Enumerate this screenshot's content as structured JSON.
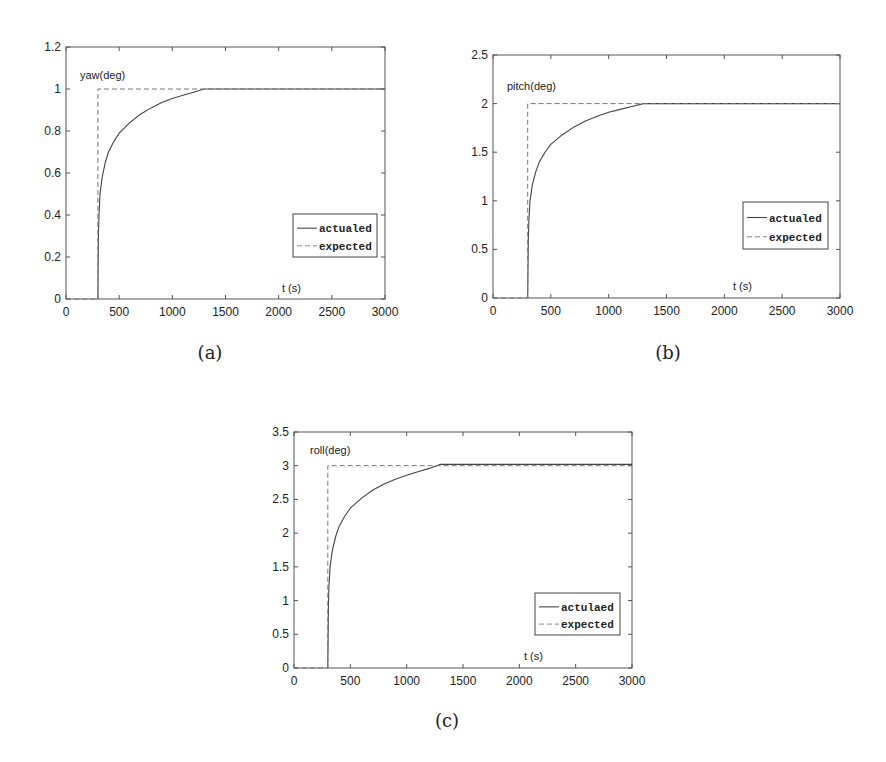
{
  "figure": {
    "captions": [
      "(a)",
      "(b)",
      "(c)"
    ]
  },
  "chart_data": [
    {
      "type": "line",
      "title": "",
      "panel": "(a)",
      "annotation_ylabel": "yaw(deg)",
      "annotation_xlabel": "t (s)",
      "xlabel": "t (s)",
      "ylabel": "yaw(deg)",
      "xlim": [
        0,
        3000
      ],
      "ylim": [
        0,
        1.2
      ],
      "xticks": [
        0,
        500,
        1000,
        1500,
        2000,
        2500,
        3000
      ],
      "yticks": [
        0,
        0.2,
        0.4,
        0.6,
        0.8,
        1,
        1.2
      ],
      "ytick_labels": [
        "0",
        "0.2",
        "0.4",
        "0.6",
        "0.8",
        "1",
        "1.2"
      ],
      "grid": false,
      "legend_position": "lower right",
      "legend": [
        "actualed",
        "expected"
      ],
      "series": [
        {
          "name": "actualed",
          "style": "solid",
          "x": [
            300,
            305,
            310,
            320,
            340,
            370,
            400,
            450,
            500,
            600,
            700,
            800,
            900,
            1000,
            1100,
            1200,
            1300,
            3000
          ],
          "y": [
            0,
            0.3,
            0.4,
            0.5,
            0.58,
            0.65,
            0.7,
            0.75,
            0.79,
            0.84,
            0.88,
            0.91,
            0.935,
            0.955,
            0.97,
            0.985,
            1.0,
            1.0
          ]
        },
        {
          "name": "expected",
          "style": "dashed",
          "x": [
            0,
            300,
            300,
            3000
          ],
          "y": [
            0,
            0,
            1,
            1
          ]
        }
      ]
    },
    {
      "type": "line",
      "title": "",
      "panel": "(b)",
      "annotation_ylabel": "pitch(deg)",
      "annotation_xlabel": "t (s)",
      "xlabel": "t (s)",
      "ylabel": "pitch(deg)",
      "xlim": [
        0,
        3000
      ],
      "ylim": [
        0,
        2.5
      ],
      "xticks": [
        0,
        500,
        1000,
        1500,
        2000,
        2500,
        3000
      ],
      "yticks": [
        0,
        0.5,
        1,
        1.5,
        2,
        2.5
      ],
      "ytick_labels": [
        "0",
        "0.5",
        "1",
        "1.5",
        "2",
        "2.5"
      ],
      "grid": false,
      "legend_position": "lower right",
      "legend": [
        "actualed",
        "expected"
      ],
      "series": [
        {
          "name": "actualed",
          "style": "solid",
          "x": [
            300,
            305,
            310,
            320,
            340,
            370,
            400,
            450,
            500,
            600,
            700,
            800,
            900,
            1000,
            1100,
            1200,
            1300,
            3000
          ],
          "y": [
            0,
            0.6,
            0.8,
            1.0,
            1.16,
            1.3,
            1.4,
            1.5,
            1.58,
            1.68,
            1.76,
            1.82,
            1.87,
            1.91,
            1.94,
            1.97,
            2.0,
            2.0
          ]
        },
        {
          "name": "expected",
          "style": "dashed",
          "x": [
            0,
            300,
            300,
            3000
          ],
          "y": [
            0,
            0,
            2,
            2
          ]
        }
      ]
    },
    {
      "type": "line",
      "title": "",
      "panel": "(c)",
      "annotation_ylabel": "roll(deg)",
      "annotation_xlabel": "t (s)",
      "xlabel": "t (s)",
      "ylabel": "roll(deg)",
      "xlim": [
        0,
        3000
      ],
      "ylim": [
        0,
        3.5
      ],
      "xticks": [
        0,
        500,
        1000,
        1500,
        2000,
        2500,
        3000
      ],
      "yticks": [
        0,
        0.5,
        1,
        1.5,
        2,
        2.5,
        3,
        3.5
      ],
      "ytick_labels": [
        "0",
        "0.5",
        "1",
        "1.5",
        "2",
        "2.5",
        "3",
        "3.5"
      ],
      "grid": false,
      "legend_position": "lower right",
      "legend": [
        "actulaed",
        "expected"
      ],
      "series": [
        {
          "name": "actulaed",
          "style": "solid",
          "x": [
            300,
            305,
            310,
            320,
            340,
            370,
            400,
            450,
            500,
            600,
            700,
            800,
            900,
            1000,
            1100,
            1200,
            1300,
            3000
          ],
          "y": [
            0,
            0.9,
            1.2,
            1.5,
            1.74,
            1.95,
            2.1,
            2.25,
            2.37,
            2.52,
            2.64,
            2.73,
            2.8,
            2.86,
            2.91,
            2.96,
            3.02,
            3.02
          ]
        },
        {
          "name": "expected",
          "style": "dashed",
          "x": [
            0,
            300,
            300,
            3000
          ],
          "y": [
            0,
            0,
            3,
            3
          ]
        }
      ]
    }
  ],
  "layout": {
    "panels": [
      {
        "left": 66,
        "top": 47,
        "right": 385,
        "bottom": 299,
        "legend": {
          "x": 293,
          "y": 214,
          "w": 84,
          "h": 43
        },
        "ylabel_pos": [
          80,
          79
        ],
        "xlabel_pos": [
          282,
          292
        ],
        "caption_pos": [
          210,
          342
        ]
      },
      {
        "left": 493,
        "top": 55,
        "right": 840,
        "bottom": 298,
        "legend": {
          "x": 743,
          "y": 202,
          "w": 85,
          "h": 47
        },
        "ylabel_pos": [
          507,
          90
        ],
        "xlabel_pos": [
          733,
          290
        ],
        "caption_pos": [
          668,
          342
        ]
      },
      {
        "left": 294,
        "top": 432,
        "right": 632,
        "bottom": 668,
        "legend": {
          "x": 535,
          "y": 593,
          "w": 85,
          "h": 42
        },
        "ylabel_pos": [
          310,
          454
        ],
        "xlabel_pos": [
          524,
          660
        ],
        "caption_pos": [
          447,
          710
        ]
      }
    ]
  }
}
